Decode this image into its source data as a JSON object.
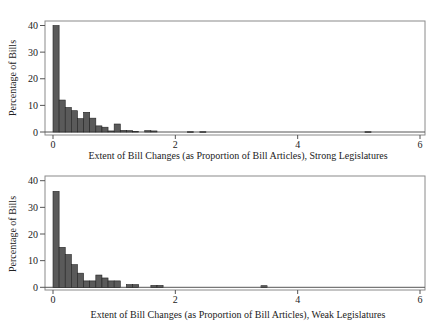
{
  "chart_data": [
    {
      "type": "bar",
      "subtype": "histogram",
      "title": "",
      "xlabel": "Extent of Bill Changes (as Proportion of Bill Articles), Strong Legislatures",
      "ylabel": "Percentage of Bills",
      "xlim": [
        0,
        6
      ],
      "ylim": [
        0,
        40
      ],
      "xticks": [
        0,
        2,
        4,
        6
      ],
      "yticks": [
        0,
        10,
        20,
        30,
        40
      ],
      "grid": false,
      "bin_width": 0.1,
      "bins": [
        {
          "x0": 0.0,
          "value": 40
        },
        {
          "x0": 0.1,
          "value": 12
        },
        {
          "x0": 0.2,
          "value": 9.2
        },
        {
          "x0": 0.3,
          "value": 8
        },
        {
          "x0": 0.4,
          "value": 5
        },
        {
          "x0": 0.5,
          "value": 7.4
        },
        {
          "x0": 0.6,
          "value": 5.2
        },
        {
          "x0": 0.7,
          "value": 2.3
        },
        {
          "x0": 0.8,
          "value": 1.8
        },
        {
          "x0": 0.9,
          "value": 0.4
        },
        {
          "x0": 1.0,
          "value": 3
        },
        {
          "x0": 1.1,
          "value": 0.6
        },
        {
          "x0": 1.2,
          "value": 0.5
        },
        {
          "x0": 1.3,
          "value": 0.2
        },
        {
          "x0": 1.5,
          "value": 0.5
        },
        {
          "x0": 1.6,
          "value": 0.4
        },
        {
          "x0": 2.2,
          "value": 0.1
        },
        {
          "x0": 2.4,
          "value": 0.1
        },
        {
          "x0": 5.1,
          "value": 0.1
        }
      ]
    },
    {
      "type": "bar",
      "subtype": "histogram",
      "title": "",
      "xlabel": "Extent of Bill Changes (as Proportion of Bill Articles), Weak Legislatures",
      "ylabel": "Percentage of Bills",
      "xlim": [
        0,
        6
      ],
      "ylim": [
        0,
        40
      ],
      "xticks": [
        0,
        2,
        4,
        6
      ],
      "yticks": [
        0,
        10,
        20,
        30,
        40
      ],
      "grid": false,
      "bin_width": 0.1,
      "bins": [
        {
          "x0": 0.0,
          "value": 36
        },
        {
          "x0": 0.1,
          "value": 15
        },
        {
          "x0": 0.2,
          "value": 12.3
        },
        {
          "x0": 0.3,
          "value": 8.5
        },
        {
          "x0": 0.4,
          "value": 5.3
        },
        {
          "x0": 0.5,
          "value": 2.4
        },
        {
          "x0": 0.6,
          "value": 2.4
        },
        {
          "x0": 0.7,
          "value": 4.6
        },
        {
          "x0": 0.8,
          "value": 3.5
        },
        {
          "x0": 0.9,
          "value": 2.4
        },
        {
          "x0": 1.0,
          "value": 2.4
        },
        {
          "x0": 1.2,
          "value": 1
        },
        {
          "x0": 1.3,
          "value": 1
        },
        {
          "x0": 1.6,
          "value": 0.7
        },
        {
          "x0": 1.7,
          "value": 0.7
        },
        {
          "x0": 3.4,
          "value": 0.6
        }
      ]
    }
  ],
  "style": {
    "bar_fill": "#5a5a5a",
    "bar_stroke": "#222222",
    "axis_color": "#555555",
    "frame_color": "#8a8a8a"
  }
}
